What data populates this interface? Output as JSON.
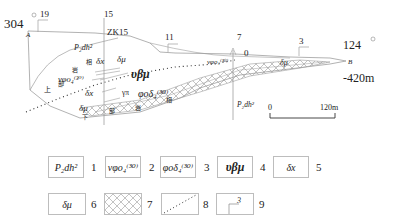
{
  "diagram": {
    "type": "geological-cross-section",
    "left_end": {
      "azimuth": "304",
      "point": "A"
    },
    "right_end": {
      "azimuth": "124",
      "point": "B",
      "elevation": "-420m"
    },
    "borehole": "ZK15",
    "exploration_lines": [
      "19",
      "15",
      "11",
      "7",
      "3"
    ],
    "top_marker": "0",
    "scale_bar": {
      "start": "0",
      "end": "120m"
    },
    "unit_labels": {
      "pdh_upper": "P₂dh²",
      "pdh_lower": "P₂dh²",
      "dx_1": "δx",
      "dmu_1": "δμ",
      "vphi_left": "νφo₄⁽³⁰⁾",
      "vphi_right": "νφo₄⁽³⁰⁾",
      "vbm": "υβμ",
      "dx_2": "δx",
      "gamma_pi": "γπ",
      "phod": "φoδ₄⁽³⁰⁾",
      "dmu_2": "δμ",
      "dmu_right": "δμ",
      "cn_xiang_1": "相",
      "cn_yan_1": "岩",
      "cn_shang": "上",
      "cn_bu": "部",
      "cn_xia": "下",
      "cn_bu2": "部",
      "cn_yan_2": "岩",
      "cn_xiang_2": "相"
    }
  },
  "legend": [
    {
      "num": "1",
      "symbol": "P₂dh²",
      "pattern": "text"
    },
    {
      "num": "2",
      "symbol": "νφo₄⁽³⁰⁾",
      "pattern": "text"
    },
    {
      "num": "3",
      "symbol": "φoδ₄⁽³⁰⁾",
      "pattern": "text"
    },
    {
      "num": "4",
      "symbol": "υβμ",
      "pattern": "text"
    },
    {
      "num": "5",
      "symbol": "δx",
      "pattern": "text"
    },
    {
      "num": "6",
      "symbol": "δμ",
      "pattern": "text"
    },
    {
      "num": "7",
      "symbol": "",
      "pattern": "crosshatch"
    },
    {
      "num": "8",
      "symbol": "",
      "pattern": "dotted-line"
    },
    {
      "num": "9",
      "symbol": "3",
      "pattern": "exploration-line"
    }
  ]
}
